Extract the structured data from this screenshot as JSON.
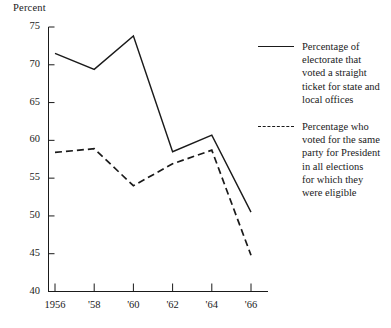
{
  "chart_data": {
    "type": "line",
    "title": "",
    "subtitle": "",
    "ylabel": "Percent",
    "xlabel": "",
    "ylim": [
      40,
      75
    ],
    "xlim": [
      "1956",
      "'66"
    ],
    "grid": false,
    "legend_position": "right",
    "categories": [
      "1956",
      "'58",
      "'60",
      "'62",
      "'64",
      "'66"
    ],
    "x_tick_labels": [
      "1956",
      "'58",
      "'60",
      "'62",
      "'64",
      "'66"
    ],
    "y_tick_labels": [
      "40",
      "45",
      "50",
      "55",
      "60",
      "65",
      "70",
      "75"
    ],
    "y_ticks": [
      40,
      45,
      50,
      55,
      60,
      65,
      70,
      75
    ],
    "series": [
      {
        "name": "Percentage of electorate that voted a straight ticket for state and local offices",
        "style": "solid",
        "color": "#1a1a1a",
        "values": [
          71.5,
          69.4,
          73.8,
          58.5,
          60.7,
          50.5
        ]
      },
      {
        "name": "Percentage who voted for the same party for President in all elections for which they were eligible",
        "style": "dashed",
        "color": "#1a1a1a",
        "values": [
          58.4,
          58.9,
          54.0,
          56.9,
          58.7,
          44.8
        ]
      }
    ]
  },
  "legend": {
    "entries": [
      {
        "style": "solid",
        "label": "Percentage of\nelectorate that\nvoted a straight\nticket for state and\nlocal offices"
      },
      {
        "style": "dashed",
        "label": "Percentage who\nvoted for the same\nparty for President\nin all elections\nfor which they\nwere eligible"
      }
    ]
  },
  "colors": {
    "ink": "#1a1a1a",
    "background": "#ffffff"
  }
}
